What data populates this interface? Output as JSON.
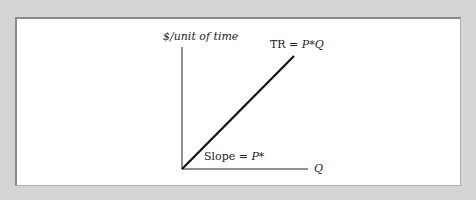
{
  "diagram": {
    "y_axis_label": "$/unit of time",
    "x_axis_label": "Q",
    "curve_label_prefix": "TR = ",
    "curve_label_var": "P*Q",
    "slope_label_prefix": "Slope = ",
    "slope_label_var": "P*",
    "colors": {
      "background": "#d4d4d4",
      "panel": "#ffffff",
      "line": "#111111"
    }
  }
}
